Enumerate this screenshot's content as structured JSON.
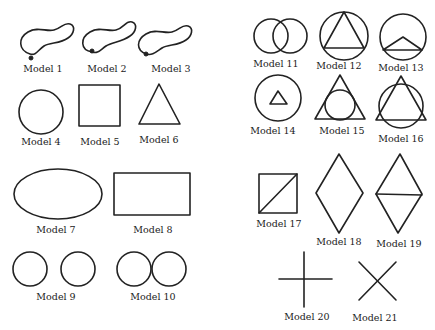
{
  "figure": {
    "stroke_color": "#222222",
    "background": "#ffffff",
    "models": [
      {
        "id": 1,
        "label": "Model 1",
        "shape": "closed-blob-with-start-dot"
      },
      {
        "id": 2,
        "label": "Model 2",
        "shape": "closed-blob-with-start-dot"
      },
      {
        "id": 3,
        "label": "Model 3",
        "shape": "closed-blob-with-start-dot"
      },
      {
        "id": 4,
        "label": "Model 4",
        "shape": "circle"
      },
      {
        "id": 5,
        "label": "Model 5",
        "shape": "square"
      },
      {
        "id": 6,
        "label": "Model 6",
        "shape": "triangle"
      },
      {
        "id": 7,
        "label": "Model 7",
        "shape": "ellipse"
      },
      {
        "id": 8,
        "label": "Model 8",
        "shape": "rectangle"
      },
      {
        "id": 9,
        "label": "Model 9",
        "shape": "two-separate-circles"
      },
      {
        "id": 10,
        "label": "Model 10",
        "shape": "two-touching-circles"
      },
      {
        "id": 11,
        "label": "Model 11",
        "shape": "two-overlapping-circles"
      },
      {
        "id": 12,
        "label": "Model 12",
        "shape": "triangle-inscribed-in-circle"
      },
      {
        "id": 13,
        "label": "Model 13",
        "shape": "circle-with-chord-triangle"
      },
      {
        "id": 14,
        "label": "Model 14",
        "shape": "small-triangle-inside-circle"
      },
      {
        "id": 15,
        "label": "Model 15",
        "shape": "circle-inscribed-in-triangle"
      },
      {
        "id": 16,
        "label": "Model 16",
        "shape": "triangle-overlapping-circle"
      },
      {
        "id": 17,
        "label": "Model 17",
        "shape": "square-with-diagonal"
      },
      {
        "id": 18,
        "label": "Model 18",
        "shape": "rhombus"
      },
      {
        "id": 19,
        "label": "Model 19",
        "shape": "rhombus-with-horizontal-diagonal"
      },
      {
        "id": 20,
        "label": "Model 20",
        "shape": "plus-cross"
      },
      {
        "id": 21,
        "label": "Model 21",
        "shape": "x-cross"
      }
    ]
  }
}
